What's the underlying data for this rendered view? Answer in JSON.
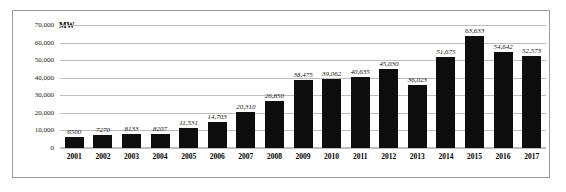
{
  "chart_data": {
    "type": "bar",
    "title": "",
    "subtitle": "",
    "xlabel": "",
    "ylabel": "MW",
    "unit_label": "MW",
    "categories": [
      "2001",
      "2002",
      "2003",
      "2004",
      "2005",
      "2006",
      "2007",
      "2008",
      "2009",
      "2010",
      "2011",
      "2012",
      "2013",
      "2014",
      "2015",
      "2016",
      "2017"
    ],
    "values": [
      6500,
      7270,
      8133,
      8207,
      11531,
      14703,
      20310,
      26850,
      38475,
      39062,
      40635,
      45030,
      36023,
      51675,
      63633,
      54642,
      52573
    ],
    "data_labels": [
      "6500",
      "7270",
      "8133",
      "8207",
      "11,531",
      "14,703",
      "20,310",
      "26,850",
      "38,475",
      "39,062",
      "40,635",
      "45,030",
      "36,023",
      "51,675",
      "63,633",
      "54,642",
      "52,573"
    ],
    "ylim": [
      0,
      70000
    ],
    "ytick_values": [
      0,
      10000,
      20000,
      30000,
      40000,
      50000,
      60000,
      70000
    ],
    "ytick_labels": [
      "0",
      "10,000",
      "20,000",
      "30,000",
      "40,000",
      "50,000",
      "60,000",
      "70,000"
    ],
    "grid": true,
    "legend": false,
    "legend_position": "none",
    "series": [
      {
        "name": "Installed capacity",
        "values": [
          6500,
          7270,
          8133,
          8207,
          11531,
          14703,
          20310,
          26850,
          38475,
          39062,
          40635,
          45030,
          36023,
          51675,
          63633,
          54642,
          52573
        ],
        "color": "#0d0d0d"
      }
    ]
  },
  "colors": {
    "bar": "#0d0d0d",
    "gridline": "#bdbdbd",
    "frame": "#9a9a9a",
    "text": "#111111",
    "background": "#ffffff"
  }
}
